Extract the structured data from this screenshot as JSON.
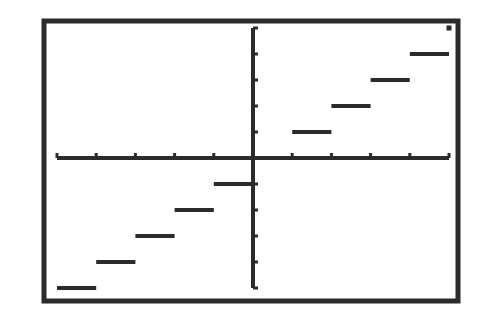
{
  "chart_data": {
    "type": "line",
    "title": "",
    "subtitle": "",
    "xlabel": "",
    "ylabel": "",
    "xlim": [
      -5,
      5
    ],
    "ylim": [
      -5,
      5
    ],
    "x_ticks": [
      -5,
      -4,
      -3,
      -2,
      -1,
      1,
      2,
      3,
      4,
      5
    ],
    "y_ticks": [
      -5,
      -4,
      -3,
      -2,
      -1,
      1,
      2,
      3,
      4,
      5
    ],
    "tick_labels_shown": false,
    "grid": false,
    "legend": null,
    "series": [
      {
        "name": "y = int(x)",
        "segments": [
          {
            "x0": -5,
            "x1": -4,
            "y": -5
          },
          {
            "x0": -4,
            "x1": -3,
            "y": -4
          },
          {
            "x0": -3,
            "x1": -2,
            "y": -3
          },
          {
            "x0": -2,
            "x1": -1,
            "y": -2
          },
          {
            "x0": -1,
            "x1": 0,
            "y": -1
          },
          {
            "x0": 0,
            "x1": 1,
            "y": 0
          },
          {
            "x0": 1,
            "x1": 2,
            "y": 1
          },
          {
            "x0": 2,
            "x1": 3,
            "y": 2
          },
          {
            "x0": 3,
            "x1": 4,
            "y": 3
          },
          {
            "x0": 4,
            "x1": 5,
            "y": 4
          }
        ],
        "points": [
          {
            "x": 5,
            "y": 5
          }
        ]
      }
    ],
    "colors": {
      "ink": "#2b2b2b",
      "background": "#ffffff"
    }
  },
  "view": {
    "frame": {
      "x": 44,
      "y": 21,
      "w": 414,
      "h": 280
    },
    "origin_px": {
      "x": 253,
      "y": 158
    },
    "x_unit_px": 39.2,
    "y_unit_px": 26.0
  }
}
